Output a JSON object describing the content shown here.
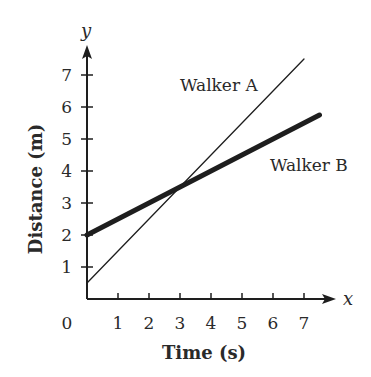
{
  "chart_data": {
    "type": "line",
    "title": "",
    "xlabel": "Time (s)",
    "ylabel": "Distance (m)",
    "x_axis_letter": "x",
    "y_axis_letter": "y",
    "origin_label": "0",
    "x_ticks": [
      1,
      2,
      3,
      4,
      5,
      6,
      7
    ],
    "y_ticks": [
      1,
      2,
      3,
      4,
      5,
      6,
      7
    ],
    "xlim": [
      0,
      8
    ],
    "ylim": [
      0,
      8
    ],
    "grid": false,
    "legend": "inline labels",
    "series": [
      {
        "name": "Walker A",
        "style": "thin",
        "x": [
          0,
          7
        ],
        "y": [
          0.5,
          7.5
        ],
        "label_pos": {
          "x": 3.0,
          "y": 6.5
        }
      },
      {
        "name": "Walker B",
        "style": "thick",
        "x": [
          0,
          7.5
        ],
        "y": [
          2,
          5.75
        ],
        "label_pos": {
          "x": 5.9,
          "y": 4.0
        }
      }
    ],
    "intersection": {
      "x": 3,
      "y": 3.5
    }
  },
  "colors": {
    "line": "#1e1e1e",
    "text": "#2a2a2a",
    "background": "#ffffff"
  }
}
